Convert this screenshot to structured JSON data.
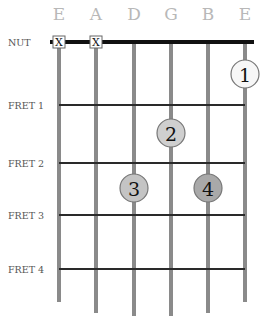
{
  "strings": [
    {
      "name": "E",
      "x": 59,
      "end_y": 302
    },
    {
      "name": "A",
      "x": 96,
      "end_y": 313
    },
    {
      "name": "D",
      "x": 134,
      "end_y": 316
    },
    {
      "name": "G",
      "x": 171,
      "end_y": 316
    },
    {
      "name": "B",
      "x": 208,
      "end_y": 313
    },
    {
      "name": "E",
      "x": 245,
      "end_y": 302
    }
  ],
  "nut": {
    "label": "NUT",
    "y": 42
  },
  "frets": [
    {
      "label": "FRET 1",
      "y": 105
    },
    {
      "label": "FRET 2",
      "y": 163
    },
    {
      "label": "FRET 3",
      "y": 215
    },
    {
      "label": "FRET 4",
      "y": 269
    }
  ],
  "muted": [
    {
      "string_index": 0,
      "label": "X"
    },
    {
      "string_index": 1,
      "label": "X"
    }
  ],
  "fingers": [
    {
      "number": "1",
      "string_index": 5,
      "y": 74,
      "fill": "#f7f7f7"
    },
    {
      "number": "2",
      "string_index": 3,
      "y": 133,
      "fill": "#cfcfcf"
    },
    {
      "number": "3",
      "string_index": 2,
      "y": 188,
      "fill": "#c4c4c4"
    },
    {
      "number": "4",
      "string_index": 4,
      "y": 188,
      "fill": "#a9a9a9"
    }
  ],
  "colors": {
    "string": "#8a8a8a",
    "fret": "#2a2a2a",
    "nut": "#111111",
    "circle_stroke": "#777777"
  }
}
